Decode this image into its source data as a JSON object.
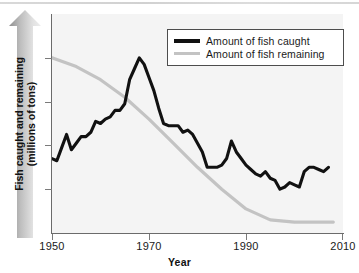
{
  "chart_data": {
    "type": "line",
    "title": "",
    "xlabel": "Year",
    "ylabel": "Fish caught and remaining (millions of tons)",
    "ylabel_line1": "Fish caught and remaining",
    "ylabel_line2": "(millions of tons)",
    "xlim": [
      1950,
      2010
    ],
    "ylim": [
      0,
      100
    ],
    "grid": false,
    "y_ticks_labeled": false,
    "legend_position": "top-right",
    "x_tick_labels": [
      "1950",
      "1970",
      "1990",
      "2010"
    ],
    "x_ticks": [
      1950,
      1970,
      1990,
      2010
    ],
    "colors": {
      "caught": "#111111",
      "remaining": "#c3c3c3",
      "axis": "#6b6b6b",
      "plot_background": "#f4f4f4",
      "arrow_dark": "#8a8a8a",
      "arrow_light": "#e8e8e8"
    },
    "series": [
      {
        "name": "Amount of fish caught",
        "color": "#111111",
        "width": 3,
        "x": [
          1950,
          1951,
          1952,
          1953,
          1954,
          1955,
          1956,
          1957,
          1958,
          1959,
          1960,
          1961,
          1962,
          1963,
          1964,
          1965,
          1966,
          1967,
          1968,
          1969,
          1970,
          1971,
          1972,
          1973,
          1974,
          1975,
          1976,
          1977,
          1978,
          1979,
          1980,
          1981,
          1982,
          1983,
          1984,
          1985,
          1986,
          1987,
          1988,
          1989,
          1990,
          1991,
          1992,
          1993,
          1994,
          1995,
          1996,
          1997,
          1998,
          1999,
          2000,
          2001,
          2002,
          2003,
          2004,
          2005,
          2006,
          2007
        ],
        "values": [
          34,
          33,
          39,
          45,
          38,
          41,
          44,
          44,
          46,
          51,
          50,
          52,
          53,
          56,
          56,
          59,
          70,
          75,
          80,
          77,
          71,
          65,
          57,
          50,
          49,
          49,
          49,
          46,
          47,
          45,
          41,
          37,
          30,
          30,
          30,
          31,
          34,
          42,
          37,
          34,
          31,
          29,
          27,
          26,
          28,
          25,
          24,
          20,
          21,
          23,
          22,
          21,
          28,
          30,
          30,
          29,
          28,
          30
        ],
        "ylabel": "millions of tons"
      },
      {
        "name": "Amount of fish remaining",
        "color": "#c3c3c3",
        "width": 3,
        "x": [
          1950,
          1955,
          1960,
          1965,
          1970,
          1975,
          1980,
          1985,
          1990,
          1995,
          2000,
          2005,
          2008
        ],
        "values": [
          80,
          76,
          70,
          62,
          52,
          41,
          30,
          20,
          11,
          6,
          5,
          5,
          5
        ],
        "ylabel": "millions of tons"
      }
    ]
  },
  "legend": {
    "entries": [
      {
        "label": "Amount of fish caught",
        "style": "caught"
      },
      {
        "label": "Amount of fish remaining",
        "style": "remaining"
      }
    ]
  }
}
